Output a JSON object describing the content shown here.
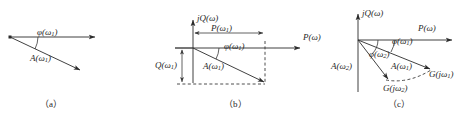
{
  "figure": {
    "width": 472,
    "height": 122,
    "background": "#ffffff",
    "stroke_color": "#2b2b2b",
    "text_color": "#262626"
  },
  "panels": [
    {
      "id": "panel-a",
      "caption": "（a）",
      "labels": {
        "phase": "φ(ω",
        "phase_sub": "1",
        "phase_close": ")",
        "magnitude": "A(ω",
        "magnitude_sub": "1",
        "magnitude_close": ")"
      }
    },
    {
      "id": "panel-b",
      "caption": "（b）",
      "labels": {
        "imag_axis": "j",
        "imag_axis_fn": "Q(ω)",
        "real_axis": "P(ω)",
        "real_part": "P(ω",
        "real_part_sub": "1",
        "real_part_close": ")",
        "imag_part": "Q(ω",
        "imag_part_sub": "1",
        "imag_part_close": ")",
        "phase": "φ(ω",
        "phase_sub": "1",
        "phase_close": ")",
        "magnitude": "A(ω",
        "magnitude_sub": "1",
        "magnitude_close": ")"
      }
    },
    {
      "id": "panel-c",
      "caption": "（c）",
      "labels": {
        "imag_axis": "j",
        "imag_axis_fn": "Q(ω)",
        "real_axis": "P(ω)",
        "phase1": "φ(ω",
        "phase1_sub": "1",
        "phase1_close": ")",
        "phase2": "φ(ω",
        "phase2_sub": "2",
        "phase2_close": ")",
        "magnitude1": "A(ω",
        "magnitude1_sub": "1",
        "magnitude1_close": ")",
        "magnitude2": "A(ω",
        "magnitude2_sub": "2",
        "magnitude2_close": ")",
        "point1": "G(jω",
        "point1_sub": "1",
        "point1_close": ")",
        "point2": "G(jω",
        "point2_sub": "2",
        "point2_close": ")"
      }
    }
  ]
}
